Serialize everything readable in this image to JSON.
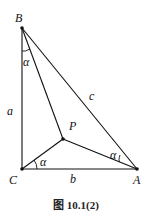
{
  "figure": {
    "caption": "图 10.1(2)",
    "points": [
      {
        "id": "B",
        "label": "B"
      },
      {
        "id": "C",
        "label": "C"
      },
      {
        "id": "A",
        "label": "A"
      },
      {
        "id": "P",
        "label": "P"
      }
    ],
    "sides": [
      {
        "id": "a",
        "label": "a",
        "between": [
          "B",
          "C"
        ]
      },
      {
        "id": "b",
        "label": "b",
        "between": [
          "C",
          "A"
        ]
      },
      {
        "id": "c",
        "label": "c",
        "between": [
          "B",
          "A"
        ]
      }
    ],
    "angle_label": "α",
    "angles": [
      {
        "at": "B",
        "between": [
          "BC",
          "BP"
        ],
        "label": "α"
      },
      {
        "at": "C",
        "between": [
          "CA",
          "CP"
        ],
        "label": "α"
      },
      {
        "at": "A",
        "between": [
          "AB",
          "AP"
        ],
        "label": "α"
      }
    ],
    "right_angle_at": "C"
  }
}
